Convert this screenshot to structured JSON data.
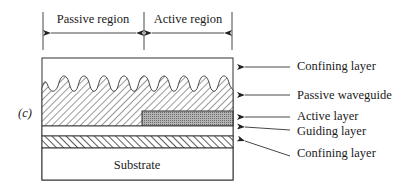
{
  "figure": {
    "panel_label": "(c)",
    "regions": {
      "passive": "Passive region",
      "active": "Active region"
    },
    "layers": {
      "substrate": "Substrate"
    },
    "callouts": [
      {
        "id": "upper-confining",
        "label": "Confining layer"
      },
      {
        "id": "passive-waveguide",
        "label": "Passive waveguide"
      },
      {
        "id": "active-layer",
        "label": "Active layer"
      },
      {
        "id": "guiding-layer",
        "label": "Guiding layer"
      },
      {
        "id": "lower-confining",
        "label": "Confining layer"
      }
    ]
  },
  "colors": {
    "line": "#2a2a2a",
    "active_fill": "#9a9a9a",
    "background": "#ffffff"
  }
}
